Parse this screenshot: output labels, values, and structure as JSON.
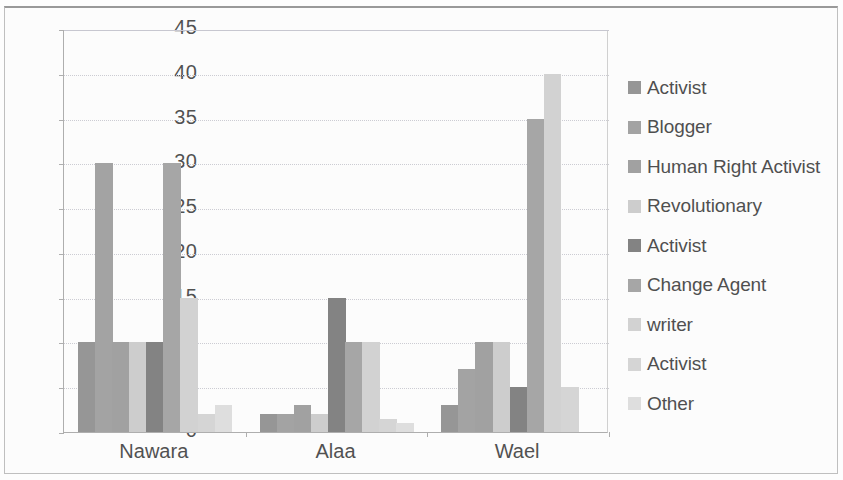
{
  "chart_data": {
    "type": "bar",
    "title": "",
    "xlabel": "",
    "ylabel": "",
    "categories": [
      "Nawara",
      "Alaa",
      "Wael"
    ],
    "ylim": [
      0,
      45
    ],
    "ytick_labels": [
      "0",
      "5",
      "10",
      "15",
      "20",
      "25",
      "30",
      "35",
      "40",
      "45"
    ],
    "ytick_values": [
      0,
      5,
      10,
      15,
      20,
      25,
      30,
      35,
      40,
      45
    ],
    "grid": true,
    "legend_position": "right",
    "series": [
      {
        "name": "Activist",
        "color": "#8c8c8c",
        "values": [
          10,
          2,
          3
        ]
      },
      {
        "name": "Blogger",
        "color": "#9a9a9a",
        "values": [
          30,
          2,
          7
        ]
      },
      {
        "name": "Human Right Activist",
        "color": "#989898",
        "values": [
          10,
          3,
          10
        ]
      },
      {
        "name": "Revolutionary",
        "color": "#c9c9c9",
        "values": [
          10,
          2,
          10
        ]
      },
      {
        "name": "Activist",
        "color": "#777777",
        "values": [
          10,
          15,
          5
        ]
      },
      {
        "name": "Change Agent",
        "color": "#9e9e9e",
        "values": [
          30,
          10,
          35
        ]
      },
      {
        "name": "writer",
        "color": "#cfcfcf",
        "values": [
          15,
          10,
          40
        ]
      },
      {
        "name": "Activist",
        "color": "#d2d2d2",
        "values": [
          2,
          1.5,
          5
        ]
      },
      {
        "name": "Other",
        "color": "#dcdcdc",
        "values": [
          3,
          1,
          0
        ]
      }
    ]
  },
  "legend": {
    "items": [
      {
        "label": "Activist"
      },
      {
        "label": "Blogger"
      },
      {
        "label": "Human Right Activist"
      },
      {
        "label": "Revolutionary"
      },
      {
        "label": "Activist"
      },
      {
        "label": "Change Agent"
      },
      {
        "label": "writer"
      },
      {
        "label": "Activist"
      },
      {
        "label": "Other"
      }
    ]
  },
  "colors": {
    "axis": "#a6a6a6",
    "grid": "#c8c8d0",
    "text": "#3f3f3f",
    "background": "#ffffff"
  }
}
